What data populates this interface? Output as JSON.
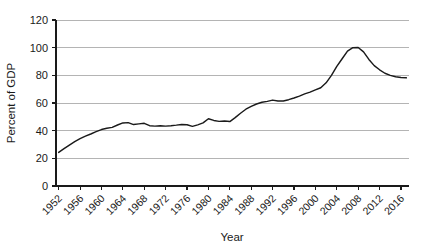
{
  "chart_data": {
    "type": "line",
    "title": "",
    "subtitle": "",
    "xlabel": "Year",
    "ylabel": "Percent of GDP",
    "xlim": [
      1951.5,
      2017.5
    ],
    "ylim": [
      0,
      120
    ],
    "grid": true,
    "grid_axis": "y",
    "legend": false,
    "legend_position": "none",
    "y_ticks": [
      0,
      20,
      40,
      60,
      80,
      100,
      120
    ],
    "y_tick_labels": [
      "0",
      "20",
      "40",
      "60",
      "80",
      "100",
      "120"
    ],
    "x_ticks": [
      1952,
      1956,
      1960,
      1964,
      1968,
      1972,
      1976,
      1980,
      1984,
      1988,
      1992,
      1996,
      2000,
      2004,
      2008,
      2012,
      2016
    ],
    "x_tick_labels": [
      "1952",
      "1956",
      "1960",
      "1964",
      "1968",
      "1972",
      "1976",
      "1980",
      "1984",
      "1988",
      "1992",
      "1996",
      "2000",
      "2004",
      "2008",
      "2012",
      "2016"
    ],
    "x_tick_label_rotation": -45,
    "line_color": "#1a1a1a",
    "grid_color": "#b4b4b4",
    "axis_color": "#1a1a1a",
    "background_color": "#ffffff",
    "series": [
      {
        "name": "Federal debt held by the public",
        "x": [
          1952,
          1953,
          1954,
          1955,
          1956,
          1957,
          1958,
          1959,
          1960,
          1961,
          1962,
          1963,
          1964,
          1965,
          1966,
          1967,
          1968,
          1969,
          1970,
          1971,
          1972,
          1973,
          1974,
          1975,
          1976,
          1977,
          1978,
          1979,
          1980,
          1981,
          1982,
          1983,
          1984,
          1985,
          1986,
          1987,
          1988,
          1989,
          1990,
          1991,
          1992,
          1993,
          1994,
          1995,
          1996,
          1997,
          1998,
          1999,
          2000,
          2001,
          2002,
          2003,
          2004,
          2005,
          2006,
          2007,
          2008,
          2009,
          2010,
          2011,
          2012,
          2013,
          2014,
          2015,
          2016,
          2017
        ],
        "values": [
          24.3,
          27.0,
          29.6,
          32.0,
          34.2,
          36.0,
          37.6,
          39.3,
          40.8,
          41.8,
          42.4,
          44.1,
          45.6,
          45.8,
          44.4,
          44.9,
          45.3,
          43.6,
          43.3,
          43.5,
          43.3,
          43.6,
          44.0,
          44.5,
          44.3,
          43.1,
          44.2,
          45.6,
          48.6,
          47.4,
          46.7,
          47.0,
          46.6,
          49.4,
          52.6,
          55.5,
          57.6,
          59.3,
          60.5,
          61.2,
          62.1,
          61.5,
          61.4,
          62.4,
          63.6,
          65.0,
          66.6,
          67.9,
          69.5,
          71.0,
          74.6,
          80.0,
          86.5,
          92.0,
          97.5,
          100.0,
          100.1,
          97.0,
          91.5,
          87.0,
          84.0,
          81.5,
          80.0,
          79.0,
          78.5,
          78.2
        ]
      }
    ]
  },
  "axes": {
    "y_axis_title": "Percent of GDP",
    "x_axis_title": "Year"
  }
}
